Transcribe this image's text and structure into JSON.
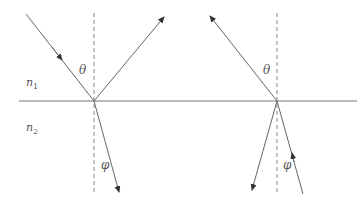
{
  "diagram": {
    "title": "",
    "colors": {
      "line": "#666666",
      "dashed": "#777777",
      "text": "#555555",
      "background": "#ffffff"
    },
    "media": {
      "upper": {
        "symbol": "n",
        "subscript": "1"
      },
      "lower": {
        "symbol": "n",
        "subscript": "2"
      }
    },
    "left_figure": {
      "angle_incident": "θ",
      "angle_refracted": "φ",
      "rays": [
        "incident (down-right toward interface)",
        "reflected (up-right)",
        "refracted (down into n2)"
      ]
    },
    "right_figure": {
      "angle_incident": "θ",
      "angle_refracted": "φ",
      "rays": [
        "ray emerging up-left into n1",
        "ray going down-left into n2",
        "ray coming up from n2 toward interface"
      ]
    }
  }
}
